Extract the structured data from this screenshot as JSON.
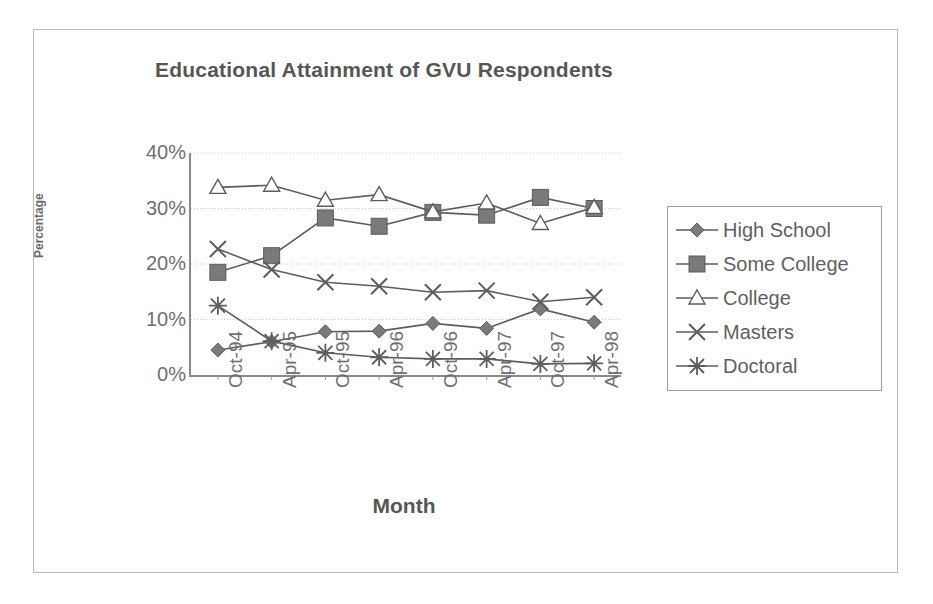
{
  "figure": {
    "title": "Educational Attainment of GVU Respondents",
    "xlabel": "Month",
    "ylabel": "Percentage"
  },
  "axis": {
    "y_ticks": [
      "40%",
      "30%",
      "20%",
      "10%",
      "0%"
    ],
    "x_ticks": [
      "Oct-94",
      "Apr-95",
      "Oct-95",
      "Apr-96",
      "Oct-96",
      "Apr-97",
      "Oct-97",
      "Apr-98"
    ]
  },
  "legend": {
    "items": [
      {
        "label": "High School",
        "marker": "diamond-marker"
      },
      {
        "label": "Some College",
        "marker": "square-marker"
      },
      {
        "label": "College",
        "marker": "triangle-marker"
      },
      {
        "label": "Masters",
        "marker": "x-marker"
      },
      {
        "label": "Doctoral",
        "marker": "asterisk-marker"
      }
    ]
  },
  "colors": {
    "line": "#5d5d5d",
    "marker_fill": "#7a7a7a",
    "text": "#6f6f6f",
    "title": "#565656",
    "frame": "#b9b9b9",
    "gridline": "#cfcfcf"
  },
  "chart_data": {
    "type": "line",
    "title": "Educational Attainment of GVU Respondents",
    "xlabel": "Month",
    "ylabel": "Percentage",
    "ylim": [
      0,
      40
    ],
    "ytick_values": [
      0,
      10,
      20,
      30,
      40
    ],
    "grid": true,
    "legend_position": "right",
    "categories": [
      "Oct-94",
      "Apr-95",
      "Oct-95",
      "Apr-96",
      "Oct-96",
      "Apr-97",
      "Oct-97",
      "Apr-98"
    ],
    "series": [
      {
        "name": "High School",
        "marker": "diamond",
        "values": [
          4.5,
          6.0,
          7.8,
          7.9,
          9.3,
          8.4,
          11.9,
          9.5
        ]
      },
      {
        "name": "Some College",
        "marker": "square",
        "values": [
          18.5,
          21.5,
          28.3,
          26.8,
          29.3,
          28.8,
          32.0,
          30.0
        ]
      },
      {
        "name": "College",
        "marker": "triangle",
        "values": [
          33.8,
          34.2,
          31.5,
          32.5,
          29.4,
          31.0,
          27.3,
          30.2
        ]
      },
      {
        "name": "Masters",
        "marker": "x",
        "values": [
          22.7,
          19.0,
          16.7,
          16.0,
          14.9,
          15.2,
          13.2,
          14.0
        ]
      },
      {
        "name": "Doctoral",
        "marker": "asterisk",
        "values": [
          12.5,
          6.1,
          4.0,
          3.2,
          2.9,
          2.9,
          2.0,
          2.1
        ]
      }
    ]
  }
}
